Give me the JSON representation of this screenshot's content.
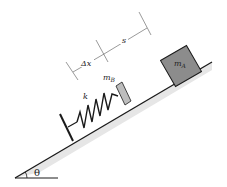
{
  "diagram": {
    "angle_label": "θ",
    "spring_label": "k",
    "block_a": {
      "label": "m",
      "subscript": "A",
      "fill": "#8c8c8c"
    },
    "plate_b": {
      "label": "m",
      "subscript": "B",
      "fill": "#bdbdbd"
    },
    "dimension_compression": "Δx",
    "dimension_gap": "s",
    "colors": {
      "line": "#1a1a1a",
      "shadow": "#c8c8c8"
    }
  }
}
